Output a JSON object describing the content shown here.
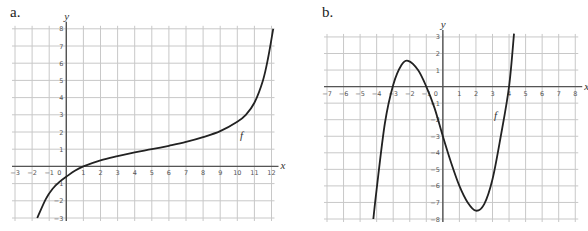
{
  "panels": [
    {
      "label": "a."
    },
    {
      "label": "b."
    }
  ],
  "chart_data": [
    {
      "type": "line",
      "panel": "a.",
      "title": "",
      "xlabel": "x",
      "ylabel": "y",
      "function_label": "f",
      "xlim": [
        -3,
        12
      ],
      "ylim": [
        -3,
        8
      ],
      "grid": true,
      "x_ticks": [
        -3,
        -2,
        -1,
        0,
        1,
        2,
        3,
        4,
        5,
        6,
        7,
        8,
        9,
        10,
        11,
        12
      ],
      "y_ticks": [
        -3,
        -2,
        -1,
        1,
        2,
        3,
        4,
        5,
        6,
        7,
        8
      ],
      "x": [
        -1.7,
        -1.2,
        -0.8,
        -0.4,
        0,
        0.5,
        1,
        2,
        3,
        4,
        5,
        6,
        7,
        8,
        9,
        10,
        10.5,
        11,
        11.5,
        11.8,
        12.1
      ],
      "y": [
        -3,
        -1.9,
        -1.3,
        -0.9,
        -0.6,
        -0.25,
        0,
        0.35,
        0.6,
        0.82,
        1.0,
        1.2,
        1.42,
        1.7,
        2.05,
        2.6,
        3.0,
        3.7,
        5.0,
        6.3,
        8
      ]
    },
    {
      "type": "line",
      "panel": "b.",
      "title": "",
      "xlabel": "x",
      "ylabel": "y",
      "function_label": "f",
      "xlim": [
        -7,
        8
      ],
      "ylim": [
        -8,
        3
      ],
      "grid": true,
      "x_ticks": [
        -7,
        -6,
        -5,
        -4,
        -3,
        -2,
        -1,
        0,
        1,
        2,
        3,
        4,
        5,
        6,
        7,
        8
      ],
      "y_ticks": [
        -8,
        -7,
        -6,
        -5,
        -4,
        -3,
        -2,
        -1,
        1,
        2,
        3
      ],
      "x": [
        -4.2,
        -4,
        -3.5,
        -3,
        -2.5,
        -2.1,
        -1.5,
        -1,
        -0.5,
        0,
        0.5,
        1,
        1.5,
        2,
        2.5,
        3,
        3.5,
        4,
        4.3
      ],
      "y": [
        -8,
        -6.2,
        -2.2,
        0.1,
        1.3,
        1.55,
        1.0,
        0,
        -1.3,
        -3.0,
        -4.6,
        -6.0,
        -7.0,
        -7.5,
        -7.1,
        -5.6,
        -3.0,
        0,
        3.2
      ]
    }
  ]
}
